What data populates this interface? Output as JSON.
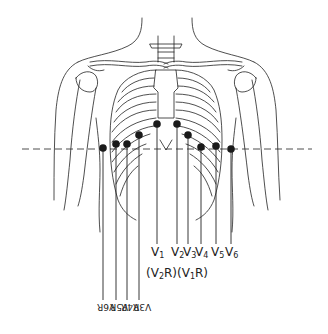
{
  "diagram": {
    "reference_line": "dashed horizontal line across chest",
    "left_leads": [
      {
        "id": "V1",
        "x": 157,
        "dot_y": 124,
        "label": "V",
        "sub": "1"
      },
      {
        "id": "V2",
        "x": 177,
        "dot_y": 124,
        "label": "V",
        "sub": "2"
      },
      {
        "id": "V3",
        "x": 188,
        "dot_y": 135,
        "label": "V",
        "sub": "3"
      },
      {
        "id": "V4",
        "x": 201,
        "dot_y": 147,
        "label": "V",
        "sub": "4"
      },
      {
        "id": "V5",
        "x": 216,
        "dot_y": 146,
        "label": "V",
        "sub": "5"
      },
      {
        "id": "V6",
        "x": 231,
        "dot_y": 149,
        "label": "V",
        "sub": "6"
      }
    ],
    "right_paren_labels": {
      "v2r": {
        "label": "(V",
        "sub": "2",
        "suffix": "R)"
      },
      "v1r": {
        "label": "(V",
        "sub": "1",
        "suffix": "R)"
      }
    },
    "right_leads": [
      {
        "id": "V6R",
        "x": 103,
        "dot_y": 148,
        "text": "V6R"
      },
      {
        "id": "V5R",
        "x": 116,
        "dot_y": 144,
        "text": "V5R"
      },
      {
        "id": "V4R",
        "x": 127,
        "dot_y": 144,
        "text": "V4R"
      },
      {
        "id": "V3R",
        "x": 139,
        "dot_y": 135,
        "text": "V3R"
      }
    ],
    "colors": {
      "line": "#222222",
      "dot": "#1a1a1a",
      "background": "#ffffff"
    }
  }
}
